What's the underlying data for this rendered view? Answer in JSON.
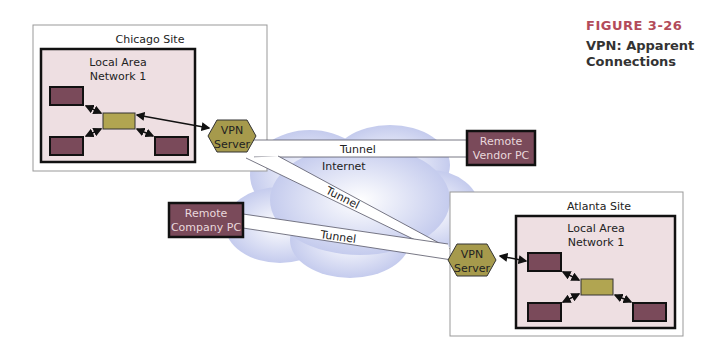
{
  "figure": {
    "number": "FIGURE 3-26",
    "title": "VPN: Apparent Connections",
    "accent_color": "#b34b5a"
  },
  "chicago": {
    "site_label": "Chicago Site",
    "lan_label_1": "Local Area",
    "lan_label_2": "Network 1",
    "vpn_1": "VPN",
    "vpn_2": "Server"
  },
  "atlanta": {
    "site_label": "Atlanta Site",
    "lan_label_1": "Local Area",
    "lan_label_2": "Network 1",
    "vpn_1": "VPN",
    "vpn_2": "Server"
  },
  "internet_label": "Internet",
  "remote_vendor": {
    "line1": "Remote",
    "line2": "Vendor PC"
  },
  "remote_company": {
    "line1": "Remote",
    "line2": "Company PC"
  },
  "tunnels": [
    "Tunnel",
    "Tunnel",
    "Tunnel"
  ],
  "colors": {
    "lan_fill": "#eedfe2",
    "host_fill": "#7a4a5a",
    "switch_fill": "#b1a551",
    "vpn_fill": "#a69a4c",
    "cloud_fill": "#c9cfee"
  }
}
